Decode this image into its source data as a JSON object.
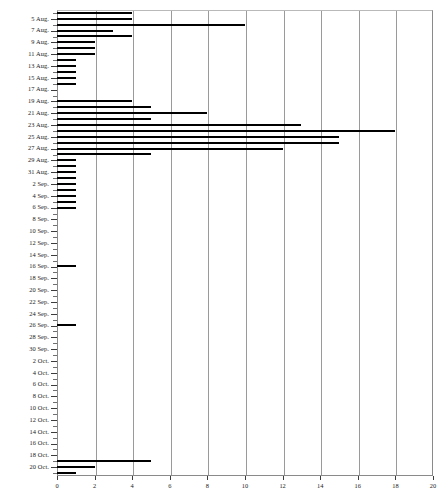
{
  "chart_data": {
    "type": "bar",
    "orientation": "horizontal",
    "title": "",
    "subtitle": "",
    "xlabel": "",
    "ylabel": "",
    "xlim": [
      0,
      20
    ],
    "ylim_categories_count": 79,
    "grid": "vertical-only",
    "legend": "none",
    "bar_color": "#000000",
    "grid_color": "#9a9a9a",
    "axis_color": "#3c3c3c",
    "x_ticks": [
      0,
      2,
      4,
      6,
      8,
      10,
      12,
      14,
      16,
      18,
      20
    ],
    "x_tick_labels": [
      "0",
      "2",
      "4",
      "6",
      "8",
      "10",
      "12",
      "14",
      "16",
      "18",
      "20"
    ],
    "categories": [
      "4 Aug.",
      "5 Aug.",
      "6 Aug.",
      "7 Aug.",
      "8 Aug.",
      "9 Aug.",
      "10 Aug.",
      "11 Aug.",
      "12 Aug.",
      "13 Aug.",
      "14 Aug.",
      "15 Aug.",
      "16 Aug.",
      "17 Aug.",
      "18 Aug.",
      "19 Aug.",
      "20 Aug.",
      "21 Aug.",
      "22 Aug.",
      "23 Aug.",
      "24 Aug.",
      "25 Aug.",
      "26 Aug.",
      "27 Aug.",
      "28 Aug.",
      "29 Aug.",
      "30 Aug.",
      "31 Aug.",
      "1 Sep.",
      "2 Sep.",
      "3 Sep.",
      "4 Sep.",
      "5 Sep.",
      "6 Sep.",
      "7 Sep.",
      "8 Sep.",
      "9 Sep.",
      "10 Sep.",
      "11 Sep.",
      "12 Sep.",
      "13 Sep.",
      "14 Sep.",
      "15 Sep.",
      "16 Sep.",
      "17 Sep.",
      "18 Sep.",
      "19 Sep.",
      "20 Sep.",
      "21 Sep.",
      "22 Sep.",
      "23 Sep.",
      "24 Sep.",
      "25 Sep.",
      "26 Sep.",
      "27 Sep.",
      "28 Sep.",
      "29 Sep.",
      "30 Sep.",
      "1 Oct.",
      "2 Oct.",
      "3 Oct.",
      "4 Oct.",
      "5 Oct.",
      "6 Oct.",
      "7 Oct.",
      "8 Oct.",
      "9 Oct.",
      "10 Oct.",
      "11 Oct.",
      "12 Oct.",
      "13 Oct.",
      "14 Oct.",
      "15 Oct.",
      "16 Oct.",
      "17 Oct.",
      "18 Oct.",
      "19 Oct.",
      "20 Oct.",
      "21 Oct."
    ],
    "labeled_categories": [
      "5 Aug.",
      "7 Aug.",
      "9 Aug.",
      "11 Aug.",
      "13 Aug.",
      "15 Aug.",
      "17 Aug.",
      "19 Aug.",
      "21 Aug.",
      "23 Aug.",
      "25 Aug.",
      "27 Aug.",
      "29 Aug.",
      "31 Aug.",
      "2 Sep.",
      "4 Sep.",
      "6 Sep.",
      "8 Sep.",
      "10 Sep.",
      "12 Sep.",
      "14 Sep.",
      "16 Sep.",
      "18 Sep.",
      "20 Sep.",
      "22 Sep.",
      "24 Sep.",
      "26 Sep.",
      "28 Sep.",
      "30 Sep.",
      "2 Oct.",
      "4 Oct.",
      "6 Oct.",
      "8 Oct.",
      "10 Oct.",
      "12 Oct.",
      "14 Oct.",
      "16 Oct.",
      "18 Oct.",
      "20 Oct."
    ],
    "values": [
      4,
      4,
      10,
      3,
      4,
      2,
      2,
      2,
      1,
      1,
      1,
      1,
      1,
      0,
      0,
      4,
      5,
      8,
      5,
      13,
      18,
      15,
      15,
      12,
      5,
      1,
      1,
      1,
      1,
      1,
      1,
      1,
      1,
      1,
      0,
      0,
      0,
      0,
      0,
      0,
      0,
      0,
      0,
      1,
      0,
      0,
      0,
      0,
      0,
      0,
      0,
      0,
      0,
      1,
      0,
      0,
      0,
      0,
      0,
      0,
      0,
      0,
      0,
      0,
      0,
      0,
      0,
      0,
      0,
      0,
      0,
      0,
      0,
      0,
      0,
      0,
      5,
      2,
      1
    ]
  }
}
